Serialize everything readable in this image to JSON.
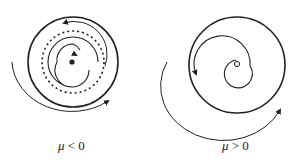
{
  "panels": [
    {
      "id": "left",
      "mu_symbol": "μ",
      "relation": " < 0",
      "description": "stable limit cycle shrinking to stable focus; unstable limit cycle (dashed)"
    },
    {
      "id": "right",
      "mu_symbol": "μ",
      "relation": " > 0",
      "description": "stable limit cycle with unstable focus at center"
    }
  ],
  "colors": {
    "stroke": "#222222",
    "background": "#ffffff"
  }
}
